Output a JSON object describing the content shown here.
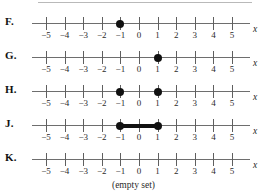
{
  "figure": {
    "kind": "multiple-choice-number-lines",
    "axis_variable": "x",
    "tick_values": [
      -5,
      -4,
      -3,
      -2,
      -1,
      0,
      1,
      2,
      3,
      4,
      5
    ],
    "tick_labels": [
      "−5",
      "−4",
      "−3",
      "−2",
      "−1",
      "0",
      "1",
      "2",
      "3",
      "4",
      "5"
    ],
    "axis_min": -5,
    "axis_max": 5,
    "caption": "(empty set)",
    "line_color": "#6e6e6e",
    "mark_color": "#111111"
  },
  "choices": [
    {
      "label": "F.",
      "name": "choice-f",
      "points": [
        -1
      ],
      "segments": []
    },
    {
      "label": "G.",
      "name": "choice-g",
      "points": [
        1
      ],
      "segments": []
    },
    {
      "label": "H.",
      "name": "choice-h",
      "points": [
        -1,
        1
      ],
      "segments": []
    },
    {
      "label": "J.",
      "name": "choice-j",
      "points": [
        -1,
        1
      ],
      "segments": [
        {
          "from": -1,
          "to": 1
        }
      ]
    },
    {
      "label": "K.",
      "name": "choice-k",
      "points": [],
      "segments": []
    }
  ]
}
